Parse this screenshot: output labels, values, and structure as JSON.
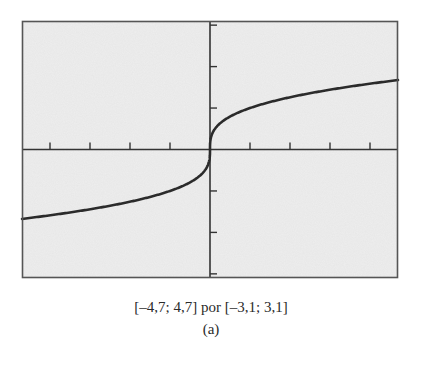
{
  "chart_data": {
    "type": "line",
    "title": "",
    "xlabel": "",
    "ylabel": "",
    "xlim": [
      -4.7,
      4.7
    ],
    "ylim": [
      -3.1,
      3.1
    ],
    "x_tick_step": 1,
    "y_tick_step": 1,
    "x_ticks": [
      -4,
      -3,
      -2,
      -1,
      1,
      2,
      3,
      4
    ],
    "y_ticks": [
      -3,
      -2,
      -1,
      1,
      2,
      3
    ],
    "grid": false,
    "legend": null,
    "series": [
      {
        "name": "curve",
        "function": "y = x^(1/3)",
        "x": [
          -4.7,
          -4,
          -3,
          -2,
          -1,
          -0.5,
          -0.1,
          -0.01,
          0,
          0.01,
          0.1,
          0.5,
          1,
          2,
          3,
          4,
          4.7
        ],
        "y": [
          -1.675,
          -1.587,
          -1.442,
          -1.26,
          -1.0,
          -0.794,
          -0.464,
          -0.215,
          0,
          0.215,
          0.464,
          0.794,
          1.0,
          1.26,
          1.442,
          1.587,
          1.675
        ]
      }
    ],
    "background_color": "#eeeeee",
    "frame_color": "#555555",
    "curve_color": "#2b2b2b"
  },
  "caption": {
    "window": "[–4,7; 4,7] por [–3,1; 3,1]",
    "label": "(a)"
  }
}
